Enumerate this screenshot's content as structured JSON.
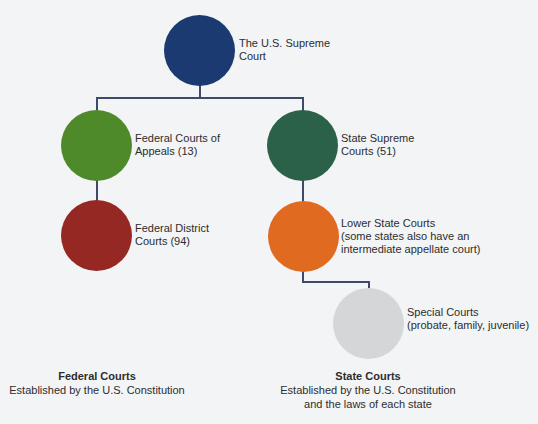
{
  "diagram": {
    "nodes": [
      {
        "id": "supreme",
        "label_line1": "The U.S. Supreme",
        "label_line2": "Court",
        "color": "#1c3a72"
      },
      {
        "id": "appeals",
        "label_line1": "Federal Courts of",
        "label_line2": "Appeals (13)",
        "color": "#4f8a2a"
      },
      {
        "id": "district",
        "label_line1": "Federal District",
        "label_line2": "Courts (94)",
        "color": "#952823"
      },
      {
        "id": "state-supreme",
        "label_line1": "State Supreme",
        "label_line2": "Courts (51)",
        "color": "#2c6149"
      },
      {
        "id": "lower-state",
        "label_line1": "Lower State Courts",
        "label_line2": "(some states also have an",
        "label_line3": "intermediate appellate court)",
        "color": "#e06a1f"
      },
      {
        "id": "special",
        "label_line1": "Special Courts",
        "label_line2": "(probate, family, juvenile)",
        "color": "#d4d6d8"
      }
    ],
    "connector_color": "#3f4a6b"
  },
  "captions": {
    "federal": {
      "title": "Federal Courts",
      "line1": "Established by the U.S. Constitution"
    },
    "state": {
      "title": "State Courts",
      "line1": "Established by the U.S. Constitution",
      "line2": "and the laws of each state"
    }
  }
}
